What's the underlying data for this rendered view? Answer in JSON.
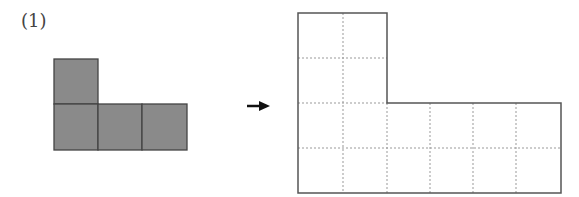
{
  "problem": {
    "label": "(1)"
  },
  "left_shape": {
    "fill": "#8a8a8a",
    "stroke": "#444444",
    "cells": [
      {
        "x": 54,
        "y": 59
      },
      {
        "x": 54,
        "y": 104
      },
      {
        "x": 98,
        "y": 104
      },
      {
        "x": 142,
        "y": 104
      }
    ],
    "cell_size": 45
  },
  "arrow": {
    "direction": "right",
    "color": "#111111"
  },
  "right_shape": {
    "stroke": "#555555",
    "grid_color": "#999999",
    "columns": [
      298,
      343,
      387,
      430,
      473,
      516,
      561
    ],
    "rows": [
      13,
      58,
      103,
      148,
      193
    ]
  }
}
